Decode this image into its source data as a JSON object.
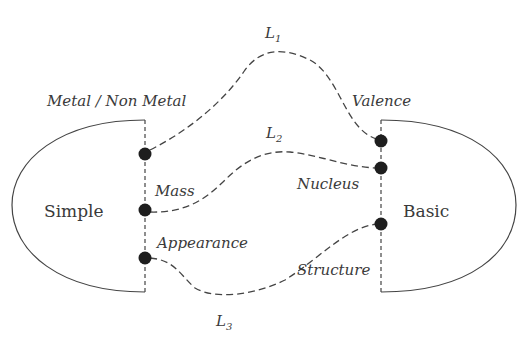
{
  "diagram": {
    "left_group": {
      "label": "Simple",
      "attributes": [
        "Metal / Non Metal",
        "Mass",
        "Appearance"
      ]
    },
    "right_group": {
      "label": "Basic",
      "attributes": [
        "Valence",
        "Nucleus",
        "Structure"
      ]
    },
    "links": [
      {
        "label": "L",
        "sub": "1",
        "from": "Metal / Non Metal",
        "to": "Valence"
      },
      {
        "label": "L",
        "sub": "2",
        "from": "Mass",
        "to": "Nucleus"
      },
      {
        "label": "L",
        "sub": "3",
        "from": "Appearance",
        "to": "Structure"
      }
    ],
    "colors": {
      "stroke": "#444444",
      "dot": "#1e1e1e",
      "text": "#3a3a3a",
      "background": "#ffffff"
    }
  }
}
